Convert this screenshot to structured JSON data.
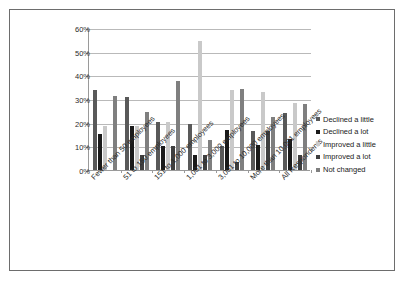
{
  "chart_data": {
    "type": "bar",
    "title": "",
    "subtitle": "",
    "xlabel": "",
    "ylabel": "",
    "ylim": [
      0,
      60
    ],
    "ytick_labels": [
      "0%",
      "10%",
      "20%",
      "30%",
      "40%",
      "50%",
      "60%"
    ],
    "ytick_values": [
      0,
      10,
      20,
      30,
      40,
      50,
      60
    ],
    "grid": true,
    "legend_position": "right",
    "value_suffix": "%",
    "categories": [
      "Fewer than 50 employees",
      "51 to 150 employees",
      "151 to 1,000 employees",
      "1,001 to 3,000 employees",
      "3,001 to 10,000 employees",
      "More than 10,001 employees",
      "All Respondents"
    ],
    "series": [
      {
        "name": "Declined a little",
        "color": "#595959",
        "values": [
          33.8,
          31.0,
          20.4,
          19.3,
          10.2,
          16.4,
          23.9
        ]
      },
      {
        "name": "Declined a lot",
        "color": "#1a1a1a",
        "values": [
          15.1,
          18.7,
          10.2,
          6.3,
          17.1,
          10.4,
          13.2
        ]
      },
      {
        "name": "Improved a little",
        "color": "#c9c9c9",
        "values": [
          18.8,
          18.6,
          20.1,
          54.4,
          33.9,
          32.9,
          28.5
        ]
      },
      {
        "name": "Improved a lot",
        "color": "#3f3f3f",
        "values": [
          0.0,
          6.2,
          10.2,
          6.3,
          3.4,
          16.4,
          6.4
        ]
      },
      {
        "name": "Not changed",
        "color": "#7f7f7f",
        "values": [
          31.3,
          24.7,
          37.8,
          12.6,
          34.2,
          22.5,
          27.7
        ]
      }
    ]
  }
}
